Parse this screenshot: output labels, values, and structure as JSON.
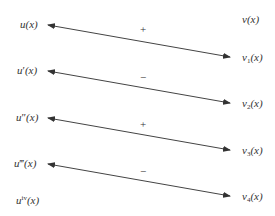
{
  "diagram": {
    "type": "tabular-integration-scheme",
    "left_column": [
      {
        "id": "u0",
        "base": "u",
        "primes": "",
        "sup": "",
        "arg": "(x)",
        "x": 20,
        "y": 19
      },
      {
        "id": "u1",
        "base": "u",
        "primes": "′",
        "sup": "",
        "arg": "(x)",
        "x": 17,
        "y": 65
      },
      {
        "id": "u2",
        "base": "u",
        "primes": "″",
        "sup": "",
        "arg": "(x)",
        "x": 16,
        "y": 112
      },
      {
        "id": "u3",
        "base": "u",
        "primes": "‴",
        "sup": "",
        "arg": "(x)",
        "x": 14,
        "y": 158
      },
      {
        "id": "u4",
        "base": "u",
        "primes": "",
        "sup": "iv",
        "arg": "(x)",
        "x": 16,
        "y": 195
      }
    ],
    "right_column": [
      {
        "id": "v0",
        "base": "v",
        "sub": "",
        "arg": "(x)",
        "x": 242,
        "y": 14
      },
      {
        "id": "v1",
        "base": "v",
        "sub": "1",
        "arg": "(x)",
        "x": 242,
        "y": 52
      },
      {
        "id": "v2",
        "base": "v",
        "sub": "2",
        "arg": "(x)",
        "x": 242,
        "y": 98
      },
      {
        "id": "v3",
        "base": "v",
        "sub": "3",
        "arg": "(x)",
        "x": 242,
        "y": 145
      },
      {
        "id": "v4",
        "base": "v",
        "sub": "4",
        "arg": "(x)",
        "x": 242,
        "y": 191
      }
    ],
    "arrows": [
      {
        "from": "u0",
        "to": "v1",
        "x1": 48,
        "y1": 25,
        "x2": 230,
        "y2": 57,
        "sign": "+",
        "sign_x": 140,
        "sign_y": 24
      },
      {
        "from": "u1",
        "to": "v2",
        "x1": 48,
        "y1": 71,
        "x2": 230,
        "y2": 103,
        "sign": "−",
        "sign_x": 140,
        "sign_y": 72
      },
      {
        "from": "u2",
        "to": "v3",
        "x1": 48,
        "y1": 118,
        "x2": 230,
        "y2": 150,
        "sign": "+",
        "sign_x": 140,
        "sign_y": 119
      },
      {
        "from": "u3",
        "to": "v4",
        "x1": 48,
        "y1": 164,
        "x2": 230,
        "y2": 196,
        "sign": "−",
        "sign_x": 140,
        "sign_y": 166
      }
    ],
    "line_color": "#444444"
  }
}
